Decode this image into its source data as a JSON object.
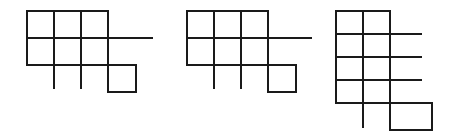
{
  "canvas": {
    "width": 452,
    "height": 140,
    "background_color": "#ffffff",
    "line_color": "#1a1a1a",
    "line_width": 2.6,
    "description": "Three black line-drawn grid lattice figures on a plain white background"
  },
  "figures": [
    {
      "id": "figure-1",
      "label": "Figure 1",
      "grid_columns": 3,
      "grid_rows": 2,
      "extra_square": "bottom-right",
      "right_protrusion_count": 1,
      "bottom_stub_count": 2,
      "cell_width": 27,
      "cell_height": 27,
      "origin_x": 27,
      "origin_y": 11,
      "segments": [
        {
          "name": "v-left-full",
          "x1": 27,
          "y1": 11,
          "x2": 27,
          "y2": 65
        },
        {
          "name": "v-col1-full-stub",
          "x1": 54,
          "y1": 11,
          "x2": 54,
          "y2": 88
        },
        {
          "name": "v-col2-full-stub",
          "x1": 81,
          "y1": 11,
          "x2": 81,
          "y2": 88
        },
        {
          "name": "v-col3-full",
          "x1": 108,
          "y1": 11,
          "x2": 108,
          "y2": 92
        },
        {
          "name": "v-extra-right",
          "x1": 136,
          "y1": 65,
          "x2": 136,
          "y2": 92
        },
        {
          "name": "h-top",
          "x1": 27,
          "y1": 11,
          "x2": 108,
          "y2": 11
        },
        {
          "name": "h-middle-protrude",
          "x1": 27,
          "y1": 38,
          "x2": 152,
          "y2": 38
        },
        {
          "name": "h-bottom",
          "x1": 27,
          "y1": 65,
          "x2": 136,
          "y2": 65
        },
        {
          "name": "h-extra-bottom",
          "x1": 108,
          "y1": 92,
          "x2": 136,
          "y2": 92
        }
      ]
    },
    {
      "id": "figure-2",
      "label": "Figure 2",
      "grid_columns": 3,
      "grid_rows": 2,
      "extra_square": "bottom-right",
      "right_protrusion_count": 1,
      "bottom_stub_count": 2,
      "cell_width": 27,
      "cell_height": 27,
      "origin_x": 187,
      "origin_y": 11,
      "segments": [
        {
          "name": "v-left-full",
          "x1": 187,
          "y1": 11,
          "x2": 187,
          "y2": 65
        },
        {
          "name": "v-col1-full-stub",
          "x1": 214,
          "y1": 11,
          "x2": 214,
          "y2": 88
        },
        {
          "name": "v-col2-full-stub",
          "x1": 241,
          "y1": 11,
          "x2": 241,
          "y2": 88
        },
        {
          "name": "v-col3-full",
          "x1": 268,
          "y1": 11,
          "x2": 268,
          "y2": 92
        },
        {
          "name": "v-extra-right",
          "x1": 296,
          "y1": 65,
          "x2": 296,
          "y2": 92
        },
        {
          "name": "h-top",
          "x1": 187,
          "y1": 11,
          "x2": 268,
          "y2": 11
        },
        {
          "name": "h-middle-protrude",
          "x1": 187,
          "y1": 38,
          "x2": 311,
          "y2": 38
        },
        {
          "name": "h-bottom",
          "x1": 187,
          "y1": 65,
          "x2": 296,
          "y2": 65
        },
        {
          "name": "h-extra-bottom",
          "x1": 268,
          "y1": 92,
          "x2": 296,
          "y2": 92
        }
      ]
    },
    {
      "id": "figure-3",
      "label": "Figure 3",
      "grid_columns": 2,
      "grid_rows": 4,
      "extra_square": "bottom-right",
      "right_protrusion_count": 3,
      "bottom_stub_count": 1,
      "cell_width": 27,
      "cell_height": 23,
      "origin_x": 336,
      "origin_y": 11,
      "segments": [
        {
          "name": "v-left-full",
          "x1": 336,
          "y1": 11,
          "x2": 336,
          "y2": 103
        },
        {
          "name": "v-col1-full-stub",
          "x1": 363,
          "y1": 11,
          "x2": 363,
          "y2": 127
        },
        {
          "name": "v-col2-full",
          "x1": 390,
          "y1": 11,
          "x2": 390,
          "y2": 130
        },
        {
          "name": "v-extra-right",
          "x1": 432,
          "y1": 103,
          "x2": 432,
          "y2": 130
        },
        {
          "name": "h-row0-top",
          "x1": 336,
          "y1": 11,
          "x2": 390,
          "y2": 11
        },
        {
          "name": "h-row1-protrude",
          "x1": 336,
          "y1": 34,
          "x2": 421,
          "y2": 34
        },
        {
          "name": "h-row2-protrude",
          "x1": 336,
          "y1": 57,
          "x2": 421,
          "y2": 57
        },
        {
          "name": "h-row3-protrude",
          "x1": 336,
          "y1": 80,
          "x2": 421,
          "y2": 80
        },
        {
          "name": "h-bottom",
          "x1": 336,
          "y1": 103,
          "x2": 432,
          "y2": 103
        },
        {
          "name": "h-extra-bottom",
          "x1": 390,
          "y1": 130,
          "x2": 432,
          "y2": 130
        }
      ]
    }
  ]
}
